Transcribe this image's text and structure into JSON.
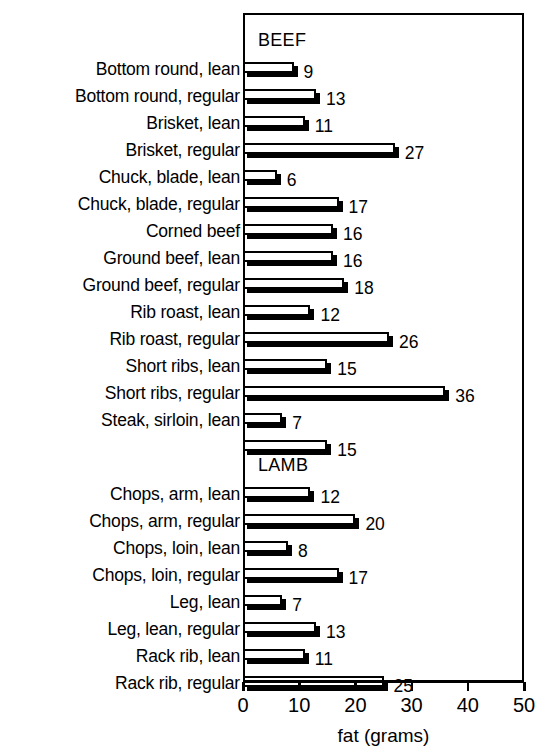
{
  "chart_data": {
    "type": "bar",
    "orientation": "horizontal",
    "title": "",
    "xlabel": "fat (grams)",
    "ylabel": "",
    "xlim": [
      0,
      50
    ],
    "xticks": [
      0,
      10,
      20,
      30,
      40,
      50
    ],
    "xtick_labels": [
      "0",
      "10",
      "20",
      "30",
      "40",
      "50"
    ],
    "grid": false,
    "legend": false,
    "bar_style": "white-fill-black-outline-with-black-drop-shadow",
    "groups": [
      {
        "name": "BEEF",
        "categories": [
          "Bottom round, lean",
          "Bottom round, regular",
          "Brisket, lean",
          "Brisket, regular",
          "Chuck, blade, lean",
          "Chuck, blade, regular",
          "Corned beef",
          "Ground beef, lean",
          "Ground beef, regular",
          "Rib roast, lean",
          "Rib roast, regular",
          "Short ribs, lean",
          "Short ribs, regular",
          "Steak, sirloin, lean",
          ""
        ],
        "values": [
          9,
          13,
          11,
          27,
          6,
          17,
          16,
          16,
          18,
          12,
          26,
          15,
          36,
          7,
          15
        ]
      },
      {
        "name": "LAMB",
        "categories": [
          "Chops, arm, lean",
          "Chops, arm, regular",
          "Chops, loin, lean",
          "Chops, loin, regular",
          "Leg, lean",
          "Leg, lean, regular",
          "Rack rib, lean",
          "Rack rib, regular"
        ],
        "values": [
          12,
          20,
          8,
          17,
          7,
          13,
          11,
          25
        ]
      }
    ]
  },
  "colors": {
    "bar_fill": "#ffffff",
    "bar_outline": "#000000",
    "bar_shadow": "#000000",
    "axis": "#000000",
    "text": "#000000",
    "background": "#ffffff"
  }
}
